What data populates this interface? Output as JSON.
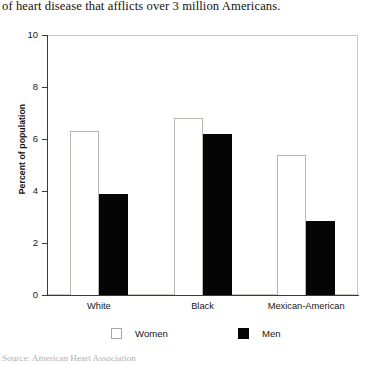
{
  "caption": {
    "clipped_above": "affect women as well as men. Coronary artery disease is the form",
    "text": "of heart disease that afflicts over 3 million Americans."
  },
  "source": {
    "text": "Source: American Heart Association"
  },
  "legend": {
    "women_label": "Women",
    "men_label": "Men"
  },
  "colors": {
    "women": "#ffffff",
    "men": "#050505",
    "axis": "#3a3a3a",
    "frame": "#c9c7c2"
  },
  "chart_data": {
    "type": "bar",
    "title": "",
    "xlabel": "",
    "ylabel": "Percent of population",
    "categories": [
      "White",
      "Black",
      "Mexican-American"
    ],
    "series": [
      {
        "name": "Women",
        "values": [
          6.3,
          6.8,
          5.4
        ]
      },
      {
        "name": "Men",
        "values": [
          3.9,
          6.2,
          2.85
        ]
      }
    ],
    "ylim": [
      0,
      10
    ],
    "yticks": [
      0,
      2,
      4,
      6,
      8,
      10
    ],
    "ytick_labels": [
      "0",
      "2",
      "4",
      "6",
      "8",
      "10"
    ],
    "grid": false,
    "legend_position": "bottom"
  }
}
